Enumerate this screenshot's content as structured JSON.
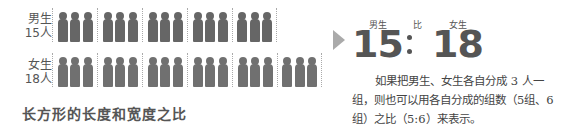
{
  "figure": {
    "rows": [
      {
        "gender": "男生",
        "count_label": "15人",
        "groups": 5,
        "per_group": 3
      },
      {
        "gender": "女生",
        "count_label": "18人",
        "groups": 6,
        "per_group": 3
      }
    ]
  },
  "ratio": {
    "left_label": "男生",
    "middle_label": "比",
    "right_label": "女生",
    "left_value": "15",
    "right_value": "18",
    "accent_color": "#aaaaaa"
  },
  "paragraph": "如果把男生、女生各自分成 3 人一组，则也可以用各自分成的组数（5组、6组）之比（5:6）来表示。",
  "heading": "长方形的长度和宽度之比"
}
